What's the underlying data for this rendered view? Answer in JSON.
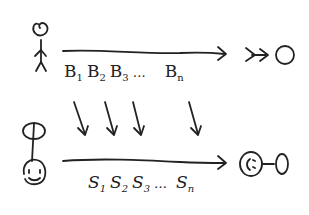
{
  "diagram": {
    "colors": {
      "ink": "#222222",
      "background": "#ffffff"
    },
    "top_row": {
      "sender_figure": "stick-figure-icon",
      "receiver_figure": "receiver-eye-icon",
      "arrow": "long-right-arrow",
      "labels": [
        {
          "base": "B",
          "sub": "1"
        },
        {
          "base": "B",
          "sub": "2"
        },
        {
          "base": "B",
          "sub": "3"
        },
        {
          "base": "",
          "sub": "",
          "ellipsis": "…"
        },
        {
          "base": "B",
          "sub": "n"
        }
      ]
    },
    "mapping_arrows": {
      "count": 4,
      "direction": "down"
    },
    "bottom_row": {
      "sender_figure": "smiley-face-icon",
      "receiver_figure": "sad-face-icon",
      "arrow": "long-right-arrow",
      "labels": [
        {
          "base": "S",
          "sub": "1"
        },
        {
          "base": "S",
          "sub": "2"
        },
        {
          "base": "S",
          "sub": "3"
        },
        {
          "base": "",
          "sub": "",
          "ellipsis": "…"
        },
        {
          "base": "S",
          "sub": "n"
        }
      ]
    }
  }
}
